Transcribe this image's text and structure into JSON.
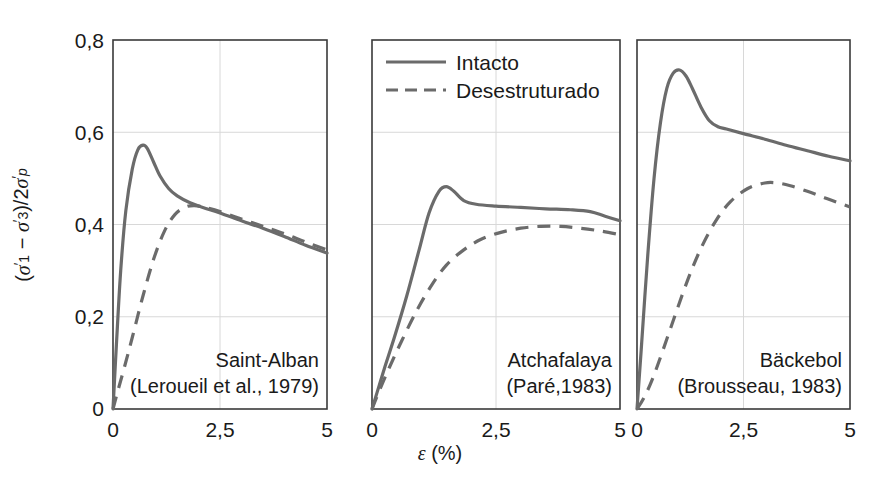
{
  "chart_data": {
    "type": "line",
    "title": "",
    "xlabel": "ε (%)",
    "ylabel": "(σ'₁ − σ'₃)/2σ'p",
    "xlim": [
      0,
      5
    ],
    "ylim": [
      0,
      0.8
    ],
    "grid": true,
    "xticks": [
      0,
      2.5,
      5
    ],
    "xtick_labels": [
      "0",
      "2,5",
      "5"
    ],
    "yticks": [
      0,
      0.2,
      0.4,
      0.6,
      0.8
    ],
    "ytick_labels": [
      "0",
      "0,2",
      "0,4",
      "0,6",
      "0,8"
    ],
    "legend": {
      "position": "top-left-panel-2",
      "entries": [
        {
          "label": "Intacto",
          "style": "solid"
        },
        {
          "label": "Desestruturado",
          "style": "dashed"
        }
      ]
    },
    "panels": [
      {
        "name": "Saint-Alban",
        "annotation_line1": "Saint-Alban",
        "annotation_line2": "(Leroueil et al., 1979)",
        "show_yaxis_labels": true,
        "series": [
          {
            "name": "Intacto",
            "style": "solid",
            "x": [
              0,
              0.08,
              0.18,
              0.3,
              0.45,
              0.58,
              0.7,
              0.8,
              0.95,
              1.1,
              1.3,
              1.5,
              1.8,
              2.1,
              2.5,
              3.0,
              3.5,
              4.0,
              4.5,
              5.0
            ],
            "y": [
              0,
              0.14,
              0.3,
              0.43,
              0.52,
              0.562,
              0.572,
              0.565,
              0.535,
              0.505,
              0.478,
              0.462,
              0.447,
              0.437,
              0.425,
              0.408,
              0.392,
              0.374,
              0.355,
              0.338
            ]
          },
          {
            "name": "Desestruturado",
            "style": "dashed",
            "x": [
              0,
              0.1,
              0.25,
              0.45,
              0.7,
              0.95,
              1.2,
              1.45,
              1.7,
              1.9,
              2.1,
              2.5,
              3.0,
              3.5,
              4.0,
              4.5,
              5.0
            ],
            "y": [
              0,
              0.035,
              0.085,
              0.155,
              0.245,
              0.325,
              0.385,
              0.422,
              0.438,
              0.441,
              0.438,
              0.428,
              0.412,
              0.396,
              0.38,
              0.362,
              0.345
            ]
          }
        ]
      },
      {
        "name": "Atchafalaya",
        "annotation_line1": "Atchafalaya",
        "annotation_line2": "(Paré,1983)",
        "show_yaxis_labels": false,
        "series": [
          {
            "name": "Intacto",
            "style": "solid",
            "x": [
              0,
              0.1,
              0.25,
              0.45,
              0.7,
              0.95,
              1.15,
              1.35,
              1.5,
              1.65,
              1.85,
              2.1,
              2.5,
              3.0,
              3.5,
              4.0,
              4.4,
              4.7,
              5.0
            ],
            "y": [
              0,
              0.035,
              0.088,
              0.155,
              0.245,
              0.345,
              0.425,
              0.472,
              0.482,
              0.472,
              0.452,
              0.444,
              0.44,
              0.437,
              0.434,
              0.432,
              0.428,
              0.418,
              0.408
            ]
          },
          {
            "name": "Desestruturado",
            "style": "dashed",
            "x": [
              0,
              0.15,
              0.35,
              0.6,
              0.9,
              1.2,
              1.5,
              1.85,
              2.2,
              2.6,
              3.0,
              3.4,
              3.8,
              4.2,
              4.6,
              5.0
            ],
            "y": [
              0,
              0.04,
              0.09,
              0.148,
              0.213,
              0.268,
              0.312,
              0.345,
              0.368,
              0.383,
              0.392,
              0.396,
              0.396,
              0.392,
              0.386,
              0.378
            ]
          }
        ]
      },
      {
        "name": "Bäckebol",
        "annotation_line1": "Bäckebol",
        "annotation_line2": "(Brousseau, 1983)",
        "show_yaxis_labels": false,
        "series": [
          {
            "name": "Intacto",
            "style": "solid",
            "x": [
              0,
              0.1,
              0.25,
              0.4,
              0.55,
              0.7,
              0.85,
              1.0,
              1.15,
              1.3,
              1.5,
              1.7,
              1.9,
              2.1,
              2.5,
              3.0,
              3.5,
              4.0,
              4.5,
              5.0
            ],
            "y": [
              0,
              0.13,
              0.33,
              0.5,
              0.62,
              0.695,
              0.728,
              0.735,
              0.722,
              0.695,
              0.655,
              0.625,
              0.612,
              0.607,
              0.597,
              0.585,
              0.572,
              0.56,
              0.548,
              0.538
            ]
          },
          {
            "name": "Desestruturado",
            "style": "dashed",
            "x": [
              0,
              0.15,
              0.35,
              0.6,
              0.9,
              1.2,
              1.5,
              1.85,
              2.2,
              2.6,
              3.0,
              3.3,
              3.6,
              4.0,
              4.4,
              4.7,
              5.0
            ],
            "y": [
              0,
              0.022,
              0.062,
              0.125,
              0.205,
              0.282,
              0.348,
              0.408,
              0.45,
              0.478,
              0.49,
              0.49,
              0.484,
              0.472,
              0.458,
              0.448,
              0.438
            ]
          }
        ]
      }
    ]
  },
  "geometry": {
    "panels": [
      {
        "left": 113,
        "right": 327
      },
      {
        "left": 372,
        "right": 620
      },
      {
        "left": 637,
        "right": 850
      }
    ],
    "top": 40,
    "bottom": 409
  }
}
